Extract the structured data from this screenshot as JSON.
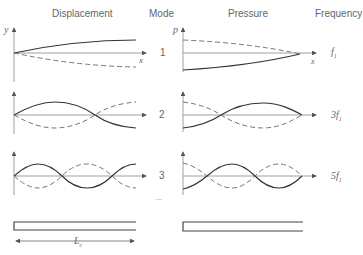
{
  "headers": {
    "displacement": "Displacement",
    "mode": "Mode",
    "pressure": "Pressure",
    "frequency": "Frequency"
  },
  "axes": {
    "displacement_y": "y",
    "pressure_y": "p",
    "x": "x"
  },
  "modes": [
    {
      "number": "1",
      "frequency": "f",
      "frequency_sub": "1",
      "frequency_coef": ""
    },
    {
      "number": "2",
      "frequency": "f",
      "frequency_sub": "1",
      "frequency_coef": "3"
    },
    {
      "number": "3",
      "frequency": "f",
      "frequency_sub": "1",
      "frequency_coef": "5"
    }
  ],
  "ellipsis": "...",
  "tube_length_label": "L",
  "tube_length_sub": "c",
  "colors": {
    "solid_curve": "#333333",
    "dashed_curve": "#777777",
    "axis": "#888888",
    "text": "#666666"
  }
}
